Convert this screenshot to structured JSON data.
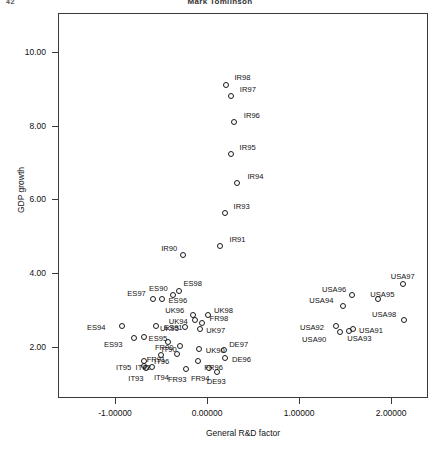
{
  "page": {
    "number": "42",
    "running_head": "Mark Tomlinson"
  },
  "chart_data": {
    "type": "scatter",
    "title": "",
    "xlabel": "General R&D factor",
    "ylabel": "GDP growth",
    "xlim": [
      -1.62,
      2.4
    ],
    "ylim": [
      0.62,
      11.05
    ],
    "grid": false,
    "legend": null,
    "xticks": [
      "-1.00000",
      "0.00000",
      "1.00000",
      "2.00000"
    ],
    "xtick_values": [
      -1.0,
      0.0,
      1.0,
      2.0
    ],
    "yticks": [
      "2.00",
      "4.00",
      "6.00",
      "8.00",
      "10.00"
    ],
    "ytick_values": [
      2.0,
      4.0,
      6.0,
      8.0,
      10.0
    ],
    "marker": "open-circle",
    "points": [
      {
        "label": "IR98",
        "x": 0.21,
        "y": 9.11,
        "lx": 8,
        "ly": -11
      },
      {
        "label": "IR97",
        "x": 0.258,
        "y": 8.81,
        "lx": 9,
        "ly": -10
      },
      {
        "label": "IR96",
        "x": 0.29,
        "y": 8.1,
        "lx": 10,
        "ly": -10
      },
      {
        "label": "IR95",
        "x": 0.255,
        "y": 7.22,
        "lx": 9,
        "ly": -10
      },
      {
        "label": "IR94",
        "x": 0.33,
        "y": 6.45,
        "lx": 10,
        "ly": -10
      },
      {
        "label": "IR93",
        "x": 0.19,
        "y": 5.63,
        "lx": 9,
        "ly": -10
      },
      {
        "label": "IR91",
        "x": 0.135,
        "y": 4.73,
        "lx": 10,
        "ly": -10
      },
      {
        "label": "IR90",
        "x": -0.26,
        "y": 4.5,
        "lx": -22,
        "ly": -10
      },
      {
        "label": "ES97",
        "x": -0.585,
        "y": 3.31,
        "lx": -26,
        "ly": -9
      },
      {
        "label": "ES96",
        "x": -0.495,
        "y": 3.3,
        "lx": 7,
        "ly": -2
      },
      {
        "label": "ES98",
        "x": -0.3,
        "y": 3.52,
        "lx": 4,
        "ly": -11
      },
      {
        "label": "ES90",
        "x": -0.37,
        "y": 3.41,
        "lx": -24,
        "ly": -10
      },
      {
        "label": "ES91",
        "x": -0.555,
        "y": 2.56,
        "lx": 8,
        "ly": -2
      },
      {
        "label": "ES95",
        "x": -0.69,
        "y": 2.27,
        "lx": 5,
        "ly": -2
      },
      {
        "label": "ES94",
        "x": -0.925,
        "y": 2.58,
        "lx": -35,
        "ly": -2
      },
      {
        "label": "ES93",
        "x": -0.795,
        "y": 2.25,
        "lx": -30,
        "ly": 3
      },
      {
        "label": "IT90",
        "x": -0.42,
        "y": 2.14,
        "lx": -7,
        "ly": 4
      },
      {
        "label": "IT92",
        "x": -0.69,
        "y": 1.62,
        "lx": -8,
        "ly": 3
      },
      {
        "label": "IT96",
        "x": -0.5,
        "y": 1.78,
        "lx": -7,
        "ly": 3
      },
      {
        "label": "IT95",
        "x": -0.685,
        "y": 1.48,
        "lx": -28,
        "ly": -2
      },
      {
        "label": "IT93",
        "x": -0.66,
        "y": 1.42,
        "lx": -18,
        "ly": 7
      },
      {
        "label": "IT94",
        "x": -0.6,
        "y": 1.45,
        "lx": 2,
        "ly": 7
      },
      {
        "label": "UK96",
        "x": -0.15,
        "y": 2.88,
        "lx": -28,
        "ly": -8
      },
      {
        "label": "UK98",
        "x": 0.01,
        "y": 2.88,
        "lx": 6,
        "ly": -8
      },
      {
        "label": "UK94",
        "x": -0.135,
        "y": 2.72,
        "lx": -26,
        "ly": -2
      },
      {
        "label": "UK95",
        "x": -0.24,
        "y": 2.53,
        "lx": -25,
        "ly": -2
      },
      {
        "label": "UK97",
        "x": -0.075,
        "y": 2.48,
        "lx": 6,
        "ly": -2
      },
      {
        "label": "UK90",
        "x": -0.09,
        "y": 1.95,
        "lx": 7,
        "ly": -2
      },
      {
        "label": "FR98",
        "x": -0.06,
        "y": 2.66,
        "lx": 8,
        "ly": -8
      },
      {
        "label": "FR90",
        "x": -0.295,
        "y": 2.04,
        "lx": -25,
        "ly": -2
      },
      {
        "label": "FR91",
        "x": -0.33,
        "y": 1.8,
        "lx": -30,
        "ly": 2
      },
      {
        "label": "FR96",
        "x": -0.095,
        "y": 1.63,
        "lx": 6,
        "ly": 3
      },
      {
        "label": "FR93",
        "x": -0.23,
        "y": 1.4,
        "lx": -18,
        "ly": 7
      },
      {
        "label": "FR94",
        "x": 0.02,
        "y": 1.43,
        "lx": -18,
        "ly": 7
      },
      {
        "label": "DE97",
        "x": 0.185,
        "y": 1.93,
        "lx": 5,
        "ly": -9
      },
      {
        "label": "DE96",
        "x": 0.195,
        "y": 1.7,
        "lx": 7,
        "ly": -2
      },
      {
        "label": "DE93",
        "x": 0.105,
        "y": 1.32,
        "lx": -10,
        "ly": 6
      },
      {
        "label": "USA97",
        "x": 2.125,
        "y": 3.7,
        "lx": -12,
        "ly": -11
      },
      {
        "label": "USA96",
        "x": 1.575,
        "y": 3.4,
        "lx": -30,
        "ly": -9
      },
      {
        "label": "USA95",
        "x": 1.86,
        "y": 3.3,
        "lx": -8,
        "ly": -8
      },
      {
        "label": "USA94",
        "x": 1.48,
        "y": 3.1,
        "lx": -34,
        "ly": -9
      },
      {
        "label": "USA98",
        "x": 2.14,
        "y": 2.72,
        "lx": -32,
        "ly": -9
      },
      {
        "label": "USA92",
        "x": 1.4,
        "y": 2.58,
        "lx": -36,
        "ly": -2
      },
      {
        "label": "USA91",
        "x": 1.585,
        "y": 2.48,
        "lx": 6,
        "ly": -2
      },
      {
        "label": "USA93",
        "x": 1.545,
        "y": 2.44,
        "lx": -2,
        "ly": 4
      },
      {
        "label": "USA90",
        "x": 1.445,
        "y": 2.4,
        "lx": -38,
        "ly": 4
      }
    ]
  }
}
